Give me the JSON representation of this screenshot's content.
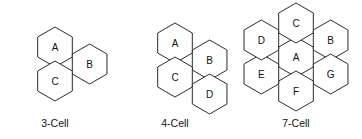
{
  "figure": {
    "background_color": "#ffffff",
    "stroke_color": "#2b2b2b",
    "label_color": "#111111",
    "hex_orientation": "pointy-top",
    "hex_radius": 20,
    "caption_y": 127
  },
  "clusters": [
    {
      "id": "cluster-3-cell",
      "caption": "3-Cell",
      "caption_x": 55,
      "origin_x": 55,
      "origin_y": 64,
      "cells": [
        {
          "label": "A",
          "col": 0,
          "row": 0,
          "offset_y": -17
        },
        {
          "label": "B",
          "col": 1,
          "row": 0,
          "offset_y": 0
        },
        {
          "label": "C",
          "col": 0,
          "row": 1,
          "offset_y": -17
        }
      ]
    },
    {
      "id": "cluster-4-cell",
      "caption": "4-Cell",
      "caption_x": 175,
      "origin_x": 175,
      "origin_y": 60,
      "cells": [
        {
          "label": "A",
          "col": 0,
          "row": 0,
          "offset_y": -17
        },
        {
          "label": "B",
          "col": 1,
          "row": 0,
          "offset_y": 0
        },
        {
          "label": "C",
          "col": 0,
          "row": 1,
          "offset_y": -17
        },
        {
          "label": "D",
          "col": 1,
          "row": 1,
          "offset_y": 0
        }
      ]
    },
    {
      "id": "cluster-7-cell",
      "caption": "7-Cell",
      "caption_x": 296,
      "origin_x": 296,
      "origin_y": 57,
      "cells": [
        {
          "label": "A",
          "col": 0,
          "row": 0,
          "offset_y": 0
        },
        {
          "label": "C",
          "col": 0,
          "row": -1,
          "offset_y": 0
        },
        {
          "label": "B",
          "col": 1,
          "row": 0,
          "offset_y": -17
        },
        {
          "label": "G",
          "col": 1,
          "row": 1,
          "offset_y": -17
        },
        {
          "label": "F",
          "col": 0,
          "row": 1,
          "offset_y": 0
        },
        {
          "label": "E",
          "col": -1,
          "row": 1,
          "offset_y": -17
        },
        {
          "label": "D",
          "col": -1,
          "row": 0,
          "offset_y": -17
        }
      ]
    }
  ]
}
